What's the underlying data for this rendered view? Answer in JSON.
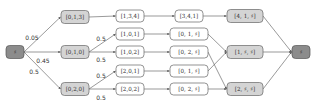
{
  "colors": {
    "terminal_fill": "#8c8c8c",
    "terminal_stroke": "#555555",
    "intermediate_fill": "#d4d4d4",
    "intermediate_stroke": "#666666",
    "plain_fill": "#ffffff",
    "plain_stroke": "#666666",
    "edge": "#555555"
  },
  "nodes": [
    {
      "id": "start",
      "label": "♯",
      "kind": "terminal",
      "x": 15,
      "y": 52,
      "w": 18,
      "h": 13
    },
    {
      "id": "n013",
      "label": "[0,1,3]",
      "kind": "intermediate",
      "x": 75,
      "y": 17,
      "w": 28,
      "h": 13
    },
    {
      "id": "n010",
      "label": "[0,1,0]",
      "kind": "intermediate",
      "x": 75,
      "y": 52,
      "w": 28,
      "h": 13
    },
    {
      "id": "n020",
      "label": "[0,2,0]",
      "kind": "intermediate",
      "x": 75,
      "y": 89,
      "w": 28,
      "h": 13
    },
    {
      "id": "n134",
      "label": "[1,3,4]",
      "kind": "plain",
      "x": 130,
      "y": 16,
      "w": 28,
      "h": 12
    },
    {
      "id": "n101",
      "label": "[1,0,1]",
      "kind": "plain",
      "x": 130,
      "y": 34,
      "w": 28,
      "h": 12
    },
    {
      "id": "n102",
      "label": "[1,0,2]",
      "kind": "plain",
      "x": 130,
      "y": 52,
      "w": 28,
      "h": 12
    },
    {
      "id": "n201",
      "label": "[2,0,1]",
      "kind": "plain",
      "x": 130,
      "y": 71,
      "w": 28,
      "h": 12
    },
    {
      "id": "n202",
      "label": "[2,0,2]",
      "kind": "plain",
      "x": 130,
      "y": 89,
      "w": 28,
      "h": 12
    },
    {
      "id": "n341",
      "label": "[3,4,1]",
      "kind": "plain",
      "x": 189,
      "y": 16,
      "w": 28,
      "h": 12
    },
    {
      "id": "n01s_a",
      "label": "[0, 1, ♯]",
      "kind": "plain",
      "x": 189,
      "y": 34,
      "w": 38,
      "h": 12
    },
    {
      "id": "n02s_a",
      "label": "[0, 2, ♯]",
      "kind": "plain",
      "x": 189,
      "y": 52,
      "w": 38,
      "h": 12
    },
    {
      "id": "n01s_b",
      "label": "[0, 1, ♯]",
      "kind": "plain",
      "x": 189,
      "y": 71,
      "w": 38,
      "h": 12
    },
    {
      "id": "n02s_b",
      "label": "[0, 2, ♯]",
      "kind": "plain",
      "x": 189,
      "y": 89,
      "w": 38,
      "h": 12
    },
    {
      "id": "n41s",
      "label": "[4, 1, ♯]",
      "kind": "intermediate",
      "x": 245,
      "y": 16,
      "w": 36,
      "h": 13
    },
    {
      "id": "n1ss",
      "label": "[1, ♯, ♯]",
      "kind": "intermediate",
      "x": 245,
      "y": 52,
      "w": 36,
      "h": 13
    },
    {
      "id": "n2ss",
      "label": "[2, ♯, ♯]",
      "kind": "intermediate",
      "x": 245,
      "y": 89,
      "w": 36,
      "h": 13
    },
    {
      "id": "end",
      "label": "♯",
      "kind": "terminal",
      "x": 301,
      "y": 52,
      "w": 18,
      "h": 13
    }
  ],
  "edges": [
    {
      "from": "start",
      "to": "n013",
      "label": "0.05",
      "lx": 32,
      "ly": 37
    },
    {
      "from": "start",
      "to": "n010",
      "label": "0.45",
      "lx": 43,
      "ly": 60
    },
    {
      "from": "start",
      "to": "n020",
      "label": "0.5",
      "lx": 34,
      "ly": 71
    },
    {
      "from": "n013",
      "to": "n134",
      "label": ""
    },
    {
      "from": "n010",
      "to": "n101",
      "label": "0.5",
      "lx": 101,
      "ly": 38
    },
    {
      "from": "n010",
      "to": "n102",
      "label": "0.5",
      "lx": 101,
      "ly": 59
    },
    {
      "from": "n020",
      "to": "n201",
      "label": "0.5",
      "lx": 101,
      "ly": 75
    },
    {
      "from": "n020",
      "to": "n202",
      "label": "0.5",
      "lx": 101,
      "ly": 97
    },
    {
      "from": "n134",
      "to": "n341",
      "label": ""
    },
    {
      "from": "n101",
      "to": "n01s_a",
      "label": ""
    },
    {
      "from": "n102",
      "to": "n02s_a",
      "label": ""
    },
    {
      "from": "n201",
      "to": "n01s_b",
      "label": ""
    },
    {
      "from": "n202",
      "to": "n02s_b",
      "label": ""
    },
    {
      "from": "n341",
      "to": "n41s",
      "label": ""
    },
    {
      "from": "n01s_a",
      "to": "n1ss",
      "label": ""
    },
    {
      "from": "n02s_a",
      "to": "n2ss",
      "label": ""
    },
    {
      "from": "n01s_b",
      "to": "n1ss",
      "label": ""
    },
    {
      "from": "n02s_b",
      "to": "n2ss",
      "label": ""
    },
    {
      "from": "n41s",
      "to": "end",
      "label": ""
    },
    {
      "from": "n1ss",
      "to": "end",
      "label": ""
    },
    {
      "from": "n2ss",
      "to": "end",
      "label": ""
    }
  ]
}
